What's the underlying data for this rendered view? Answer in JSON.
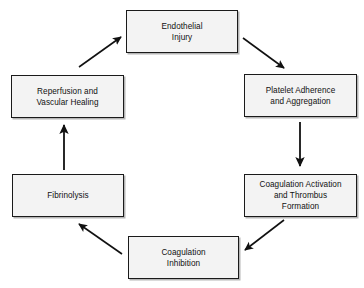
{
  "diagram": {
    "type": "cyclic-flowchart",
    "style": {
      "box_fill": "#f3f3f3",
      "box_border": "#1a1a1a",
      "arrow_color": "#111111",
      "background": "#ffffff",
      "shadow": "#787878"
    },
    "nodes": [
      {
        "id": "endothelial-injury",
        "label": "Endothelial\nInjury"
      },
      {
        "id": "platelet-adherence",
        "label": "Platelet Adherence\nand Aggregation"
      },
      {
        "id": "coagulation-activation",
        "label": "Coagulation Activation\nand Thrombus\nFormation"
      },
      {
        "id": "coagulation-inhibition",
        "label": "Coagulation\nInhibition"
      },
      {
        "id": "fibrinolysis",
        "label": "Fibrinolysis"
      },
      {
        "id": "reperfusion",
        "label": "Reperfusion and\nVascular Healing"
      }
    ],
    "edges": [
      {
        "id": "edge-injury-to-platelet",
        "from": "endothelial-injury",
        "to": "platelet-adherence",
        "direction": "down-right"
      },
      {
        "id": "edge-platelet-to-coagulation",
        "from": "platelet-adherence",
        "to": "coagulation-activation",
        "direction": "down"
      },
      {
        "id": "edge-coagulation-to-inhibition",
        "from": "coagulation-activation",
        "to": "coagulation-inhibition",
        "direction": "down-left"
      },
      {
        "id": "edge-inhibition-to-fibrinolysis",
        "from": "coagulation-inhibition",
        "to": "fibrinolysis",
        "direction": "up-left"
      },
      {
        "id": "edge-fibrinolysis-to-reperfusion",
        "from": "fibrinolysis",
        "to": "reperfusion",
        "direction": "up"
      },
      {
        "id": "edge-reperfusion-to-injury",
        "from": "reperfusion",
        "to": "endothelial-injury",
        "direction": "up-right"
      }
    ]
  }
}
